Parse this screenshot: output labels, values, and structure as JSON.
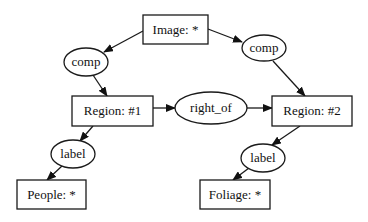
{
  "diagram": {
    "type": "graph",
    "nodes": [
      {
        "id": "image",
        "label": "Image: *",
        "shape": "box",
        "x": 143,
        "y": 15,
        "w": 65,
        "h": 29
      },
      {
        "id": "comp_left",
        "label": "comp",
        "shape": "ellipse",
        "cx": 86,
        "cy": 62,
        "rx": 22,
        "ry": 14
      },
      {
        "id": "comp_right",
        "label": "comp",
        "shape": "ellipse",
        "cx": 264,
        "cy": 48,
        "rx": 22,
        "ry": 13
      },
      {
        "id": "region1",
        "label": "Region: #1",
        "shape": "box",
        "x": 72,
        "y": 96,
        "w": 81,
        "h": 30
      },
      {
        "id": "right_of",
        "label": "right_of",
        "shape": "ellipse",
        "cx": 211,
        "cy": 108,
        "rx": 36,
        "ry": 16
      },
      {
        "id": "region2",
        "label": "Region: #2",
        "shape": "box",
        "x": 272,
        "y": 96,
        "w": 80,
        "h": 30
      },
      {
        "id": "label_left",
        "label": "label",
        "shape": "ellipse",
        "cx": 73,
        "cy": 154,
        "rx": 22,
        "ry": 14
      },
      {
        "id": "label_right",
        "label": "label",
        "shape": "ellipse",
        "cx": 263,
        "cy": 158,
        "rx": 22,
        "ry": 14
      },
      {
        "id": "people",
        "label": "People: *",
        "shape": "box",
        "x": 17,
        "y": 180,
        "w": 69,
        "h": 29
      },
      {
        "id": "foliage",
        "label": "Foliage: *",
        "shape": "box",
        "x": 200,
        "y": 180,
        "w": 70,
        "h": 29
      }
    ],
    "edges": [
      {
        "from": "image",
        "to": "comp_left"
      },
      {
        "from": "image",
        "to": "comp_right"
      },
      {
        "from": "comp_left",
        "to": "region1"
      },
      {
        "from": "comp_right",
        "to": "region2"
      },
      {
        "from": "region1",
        "to": "right_of"
      },
      {
        "from": "right_of",
        "to": "region2"
      },
      {
        "from": "region1",
        "to": "label_left"
      },
      {
        "from": "region2",
        "to": "label_right"
      },
      {
        "from": "label_left",
        "to": "people"
      },
      {
        "from": "label_right",
        "to": "foliage"
      }
    ]
  },
  "labels": {
    "image": "Image: *",
    "comp_left": "comp",
    "comp_right": "comp",
    "region1": "Region: #1",
    "right_of": "right_of",
    "region2": "Region: #2",
    "label_left": "label",
    "label_right": "label",
    "people": "People: *",
    "foliage": "Foliage: *"
  },
  "colors": {
    "stroke": "#1a1a1a",
    "fill": "#ffffff",
    "text": "#111111",
    "background": "#ffffff"
  }
}
